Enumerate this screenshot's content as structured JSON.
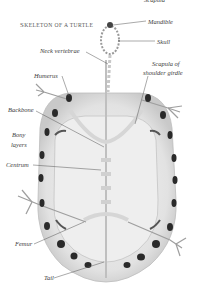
{
  "figure": {
    "title": "Skeleton of a turtle",
    "top_cut_label": "Scapula",
    "labels": {
      "mandible": "Mandible",
      "skull": "Skull",
      "neck_vertebrae": "Neck vertebrae",
      "humerus": "Humerus",
      "scapula_line1": "Scapula of",
      "scapula_line2": "shoulder girdle",
      "backbone": "Backbone",
      "bony_line1": "Bony",
      "bony_line2": "layers",
      "centrum": "Centrum",
      "femur": "Femur",
      "tail": "Tail"
    },
    "colors": {
      "background": "#ffffff",
      "bone": "#e9e9e9",
      "shell_shadow": "#cfcfcf",
      "spots": "#2a2a2a",
      "leader_lines": "#555555"
    }
  }
}
